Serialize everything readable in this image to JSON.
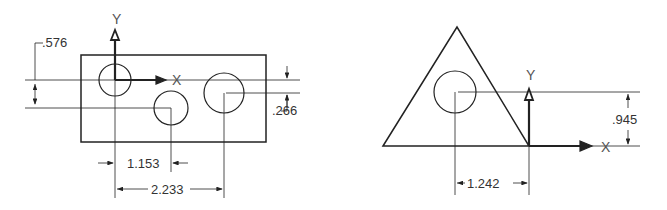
{
  "left_drawing": {
    "axis_labels": {
      "y": "Y",
      "x": "X"
    },
    "dimensions": {
      "vertical_hole_offset": ".576",
      "vertical_right_offset": ".266",
      "horizontal_short": "1.153",
      "horizontal_long": "2.233"
    }
  },
  "right_drawing": {
    "axis_labels": {
      "y": "Y",
      "x": "X"
    },
    "dimensions": {
      "vertical": ".945",
      "horizontal": "1.242"
    }
  }
}
